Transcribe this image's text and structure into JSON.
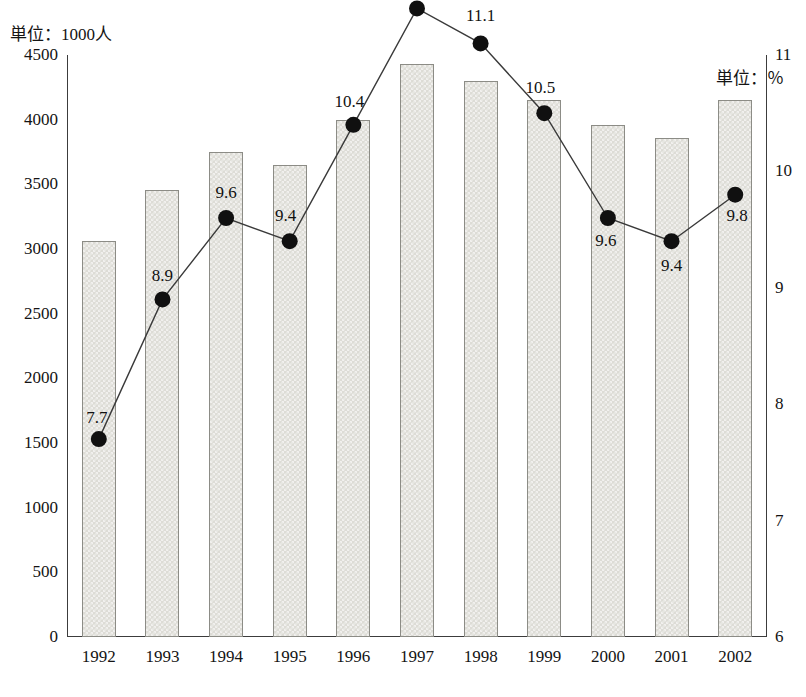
{
  "axis": {
    "left_unit_label": "単位：1000人",
    "right_unit_label": "単位：％",
    "left_ticks": [
      "4500",
      "4000",
      "3500",
      "3000",
      "2500",
      "2000",
      "1500",
      "1000",
      "500",
      "0"
    ],
    "right_ticks": [
      "11",
      "10",
      "9",
      "8",
      "7",
      "6"
    ]
  },
  "chart_data": {
    "type": "bar",
    "title": "",
    "xlabel": "",
    "ylabel": "単位：1000人",
    "y2label": "単位：％",
    "grid": false,
    "legend": "none",
    "categories": [
      "1992",
      "1993",
      "1994",
      "1995",
      "1996",
      "1997",
      "1998",
      "1999",
      "2000",
      "2001",
      "2002"
    ],
    "ylim": [
      0,
      4500
    ],
    "y2lim": [
      6,
      11
    ],
    "y_ticks": [
      0,
      500,
      1000,
      1500,
      2000,
      2500,
      3000,
      3500,
      4000,
      4500
    ],
    "y2_ticks": [
      6,
      7,
      8,
      9,
      10,
      11
    ],
    "series": [
      {
        "name": "bars",
        "type": "bar",
        "axis": "left",
        "values": [
          3060,
          3460,
          3750,
          3650,
          4000,
          4430,
          4300,
          4150,
          3960,
          3860,
          4150
        ]
      },
      {
        "name": "line",
        "type": "line",
        "axis": "right",
        "values": [
          7.7,
          8.9,
          9.6,
          9.4,
          10.4,
          11.4,
          11.1,
          10.5,
          9.6,
          9.4,
          9.8
        ],
        "labels": [
          "7.7",
          "8.9",
          "9.6",
          "9.4",
          "10.4",
          "11.4",
          "11.1",
          "10.5",
          "9.6",
          "9.4",
          "9.8"
        ]
      }
    ]
  },
  "colors": {
    "bar_fill": "#dddcd6",
    "bar_border": "#8c8c86",
    "line": "#3a3a3a",
    "marker": "#101010",
    "axis": "#3c3c3c",
    "text": "#141414"
  }
}
